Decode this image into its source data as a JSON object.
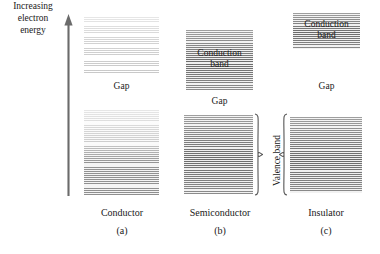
{
  "figure": {
    "axis_label": "Increasing electron energy",
    "axis_label_lines": [
      "Increasing",
      "electron",
      "energy"
    ],
    "arrow_direction": "up",
    "valence_band_label": "Valence band",
    "gap_label": "Gap",
    "conduction_band_label": "Conduction band",
    "conduction_band_lines": [
      "Conduction",
      "band"
    ],
    "colors": {
      "ink": "#1a1a1a",
      "background": "#ffffff",
      "band_faint": "#c9c9c9",
      "band_light": "#b4b4b4",
      "band_mid": "#8f8f8f",
      "band_dark": "#5a5a5a",
      "arrow": "#6b6b6b",
      "brace": "#555555"
    },
    "columns": [
      {
        "name": "conductor",
        "title": "Conductor",
        "tag": "(a)",
        "upper_band_label": "",
        "gap_label": "Gap",
        "lower_band_label": ""
      },
      {
        "name": "semiconductor",
        "title": "Semiconductor",
        "tag": "(b)",
        "upper_band_label": "Conduction band",
        "gap_label": "Gap",
        "lower_band_label": "Valence band"
      },
      {
        "name": "insulator",
        "title": "Insulator",
        "tag": "(c)",
        "upper_band_label": "Conduction band",
        "gap_label": "Gap",
        "lower_band_label": "Valence band"
      }
    ]
  }
}
